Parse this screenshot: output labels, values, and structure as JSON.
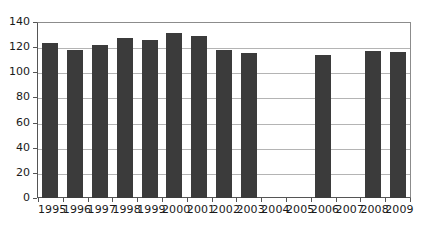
{
  "chart_data": {
    "type": "bar",
    "title": "",
    "subtitle": "",
    "xlabel": "",
    "ylabel": "",
    "categories": [
      "1995",
      "1996",
      "1997",
      "1998",
      "1999",
      "2000",
      "2001",
      "2002",
      "2003",
      "2004",
      "2005",
      "2006",
      "2007",
      "2008",
      "2009"
    ],
    "values": [
      123,
      118,
      122,
      127,
      126,
      131,
      129,
      118,
      115,
      null,
      null,
      114,
      null,
      117,
      116
    ],
    "missing_categories": [
      "2004",
      "2005",
      "2007"
    ],
    "ylim": [
      0,
      140
    ],
    "yticks": [
      0,
      20,
      40,
      60,
      80,
      100,
      120,
      140
    ],
    "ytick_labels": [
      "0",
      "20",
      "40",
      "60",
      "80",
      "100",
      "120",
      "140"
    ],
    "grid": true,
    "grid_axis": "y",
    "legend": false,
    "legend_position": "none",
    "series": [
      {
        "name": "",
        "color": "#3b3b3b",
        "values": [
          123,
          118,
          122,
          127,
          126,
          131,
          129,
          118,
          115,
          null,
          null,
          114,
          null,
          117,
          116
        ]
      }
    ],
    "annotations": []
  },
  "colors": {
    "bar": "#3b3b3b",
    "gridline": "#b4b4b4",
    "axis": "#555555",
    "frame": "#8c8c8c",
    "text": "#1a1a1a",
    "background": "#ffffff"
  }
}
